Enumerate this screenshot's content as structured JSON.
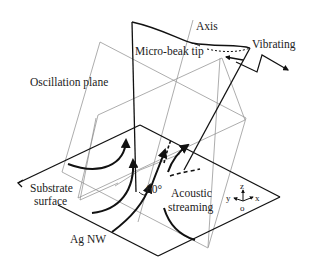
{
  "figure": {
    "type": "schematic"
  },
  "labels": {
    "axis": "Axis",
    "tip": "Micro-beak tip",
    "vibrating": "Vibrating",
    "oscillation_plane": "Oscillation plane",
    "substrate_line1": "Substrate",
    "substrate_line2": "surface",
    "angle": "60°",
    "streaming_line1": "Acoustic",
    "streaming_line2": "streaming",
    "nanowire": "Ag NW"
  },
  "coordinate_system": {
    "z": "z",
    "y": "y",
    "x": "x",
    "origin": "o"
  },
  "colors": {
    "stroke_main": "#111111",
    "stroke_plane": "#8a8a8a",
    "text": "#222222",
    "background": "#ffffff"
  }
}
